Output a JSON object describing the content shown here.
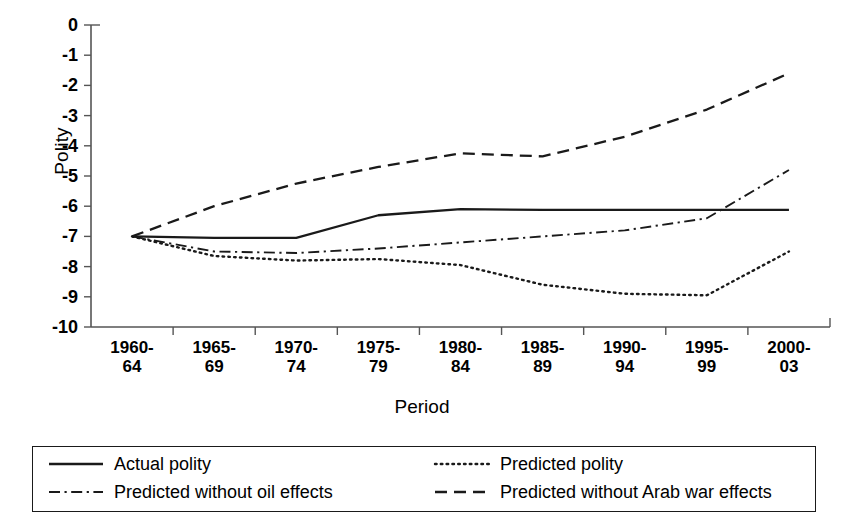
{
  "chart_data": {
    "type": "line",
    "title": "",
    "xlabel": "Period",
    "ylabel": "Polity",
    "ylim": [
      -10,
      0
    ],
    "yticks": [
      0,
      -1,
      -2,
      -3,
      -4,
      -5,
      -6,
      -7,
      -8,
      -9,
      -10
    ],
    "ytick_labels": [
      "0",
      "-1",
      "-2",
      "-3",
      "-4",
      "-5",
      "-6",
      "-7",
      "-8",
      "-9",
      "-10"
    ],
    "grid": false,
    "legend_position": "bottom",
    "categories": [
      "1960-\n64",
      "1965-\n69",
      "1970-\n74",
      "1975-\n79",
      "1980-\n84",
      "1985-\n89",
      "1990-\n94",
      "1995-\n99",
      "2000-\n03"
    ],
    "category_lines": [
      [
        "1960-",
        "64"
      ],
      [
        "1965-",
        "69"
      ],
      [
        "1970-",
        "74"
      ],
      [
        "1975-",
        "79"
      ],
      [
        "1980-",
        "84"
      ],
      [
        "1985-",
        "89"
      ],
      [
        "1990-",
        "94"
      ],
      [
        "1995-",
        "99"
      ],
      [
        "2000-",
        "03"
      ]
    ],
    "series": [
      {
        "name": "Actual polity",
        "style": "solid",
        "color": "#1a1a1a",
        "values": [
          -7.0,
          -7.05,
          -7.05,
          -6.3,
          -6.1,
          -6.12,
          -6.12,
          -6.12,
          -6.12
        ]
      },
      {
        "name": "Predicted polity",
        "style": "dotted",
        "color": "#1a1a1a",
        "values": [
          -7.0,
          -7.65,
          -7.8,
          -7.75,
          -7.95,
          -8.6,
          -8.9,
          -8.95,
          -7.5
        ]
      },
      {
        "name": "Predicted without oil effects",
        "style": "dashdot",
        "color": "#1a1a1a",
        "values": [
          -7.0,
          -7.5,
          -7.55,
          -7.4,
          -7.2,
          -7.0,
          -6.8,
          -6.4,
          -4.8
        ]
      },
      {
        "name": "Predicted without Arab war effects",
        "style": "dashed",
        "color": "#1a1a1a",
        "values": [
          -7.0,
          -6.0,
          -5.25,
          -4.7,
          -4.25,
          -4.35,
          -3.7,
          -2.8,
          -1.6
        ]
      }
    ]
  },
  "axes": {
    "y_title": "Polity",
    "x_title": "Period"
  },
  "legend": {
    "items": [
      {
        "label": "Actual polity",
        "style": "solid"
      },
      {
        "label": "Predicted polity",
        "style": "dotted"
      },
      {
        "label": "Predicted without oil effects",
        "style": "dashdot"
      },
      {
        "label": "Predicted without Arab war effects",
        "style": "dashed"
      }
    ]
  }
}
